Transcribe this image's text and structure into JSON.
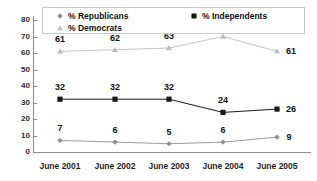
{
  "chart_data": {
    "type": "line",
    "title": "",
    "xlabel": "",
    "ylabel": "",
    "ylim": [
      0,
      80
    ],
    "yticks": [
      0,
      10,
      20,
      30,
      40,
      50,
      60,
      70,
      80
    ],
    "grid": false,
    "legend_position": "top",
    "categories": [
      "June 2001",
      "June 2002",
      "June 2003",
      "June 2004",
      "June 2005"
    ],
    "series": [
      {
        "name": "% Republicans",
        "marker": "diamond-icon",
        "color": "#8f8f8f",
        "values": [
          7,
          6,
          5,
          6,
          9
        ],
        "labels": [
          "7",
          "6",
          "5",
          "6",
          "9"
        ]
      },
      {
        "name": "% Democrats",
        "marker": "triangle-icon",
        "color": "#bdbdbd",
        "values": [
          61,
          62,
          63,
          70,
          61
        ],
        "labels": [
          "61",
          "62",
          "63",
          "70",
          "61"
        ]
      },
      {
        "name": "% Independents",
        "marker": "square-icon",
        "color": "#1a1a1a",
        "values": [
          32,
          32,
          32,
          24,
          26
        ],
        "labels": [
          "32",
          "32",
          "32",
          "24",
          "26"
        ]
      }
    ]
  },
  "axis": {
    "y_tick_labels": [
      "80",
      "70",
      "60",
      "50",
      "40",
      "30",
      "20",
      "10",
      "0"
    ],
    "x_tick_labels": [
      "June 2001",
      "June 2002",
      "June 2003",
      "June 2004",
      "June 2005"
    ]
  },
  "legend": {
    "republicans": "% Republicans",
    "democrats": "% Democrats",
    "independents": "% Independents"
  }
}
